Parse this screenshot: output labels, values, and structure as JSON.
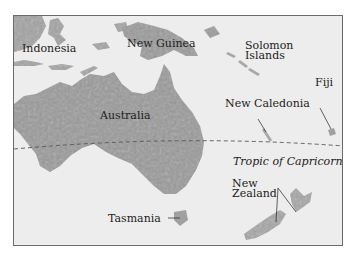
{
  "map": {
    "title": "",
    "labels": {
      "indonesia": "Indonesia",
      "new_guinea": "New Guinea",
      "solomon_line1": "Solomon",
      "solomon_line2": "Islands",
      "fiji": "Fiji",
      "new_caledonia": "New Caledonia",
      "australia": "Australia",
      "tropic": "Tropic of Capricorn",
      "nz_line1": "New",
      "nz_line2": "Zealand",
      "tasmania": "Tasmania"
    },
    "colors": {
      "ocean": "#ededed",
      "land": "#9a9a9a",
      "land_dark": "#858585",
      "border": "#6a6a6a",
      "text": "#1c1c1c",
      "tropic_line": "#555555"
    }
  }
}
